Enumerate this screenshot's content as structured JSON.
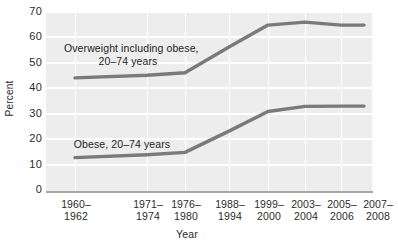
{
  "chart_data": {
    "type": "line",
    "title": "",
    "xlabel": "Year",
    "ylabel": "Percent",
    "ylim": [
      0,
      70
    ],
    "ytick_values": [
      70,
      60,
      50,
      40,
      30,
      20,
      10,
      0
    ],
    "grid": true,
    "legend_position": "inline-annotation",
    "categories": [
      "1960–1962",
      "1971–1974",
      "1976–1980",
      "1988–1994",
      "1999–2000",
      "2003–2004",
      "2005–2006",
      "2007–2008"
    ],
    "series": [
      {
        "name": "Overweight including obese, 20–74 years",
        "color": "#7a7a7a",
        "values": [
          44.0,
          45.0,
          46.0,
          56.0,
          64.5,
          65.7,
          64.5,
          64.5
        ]
      },
      {
        "name": "Obese, 20–74 years",
        "color": "#7a7a7a",
        "values": [
          13.0,
          14.1,
          15.0,
          23.3,
          30.9,
          32.9,
          33.0,
          33.0
        ]
      }
    ],
    "annotations": [
      {
        "id": "overweight",
        "line1": "Overweight including obese,",
        "line2": "20–74 years"
      },
      {
        "id": "obese",
        "line1": "Obese, 20–74 years",
        "line2": ""
      }
    ],
    "colors": {
      "plot_background": "#ededed",
      "gridline": "#ffffff",
      "line": "#7a7a7a",
      "axis": "#a8a8a8",
      "text": "#2b2b2b"
    }
  },
  "axes": {
    "y_title": "Percent",
    "x_title": "Year",
    "y_ticks": [
      {
        "label": "70"
      },
      {
        "label": "60"
      },
      {
        "label": "50"
      },
      {
        "label": "40"
      },
      {
        "label": "30"
      },
      {
        "label": "20"
      },
      {
        "label": "10"
      },
      {
        "label": "0"
      }
    ],
    "x_ticks": [
      {
        "top": "1960–",
        "bottom": "1962"
      },
      {
        "top": "1971–",
        "bottom": "1974"
      },
      {
        "top": "1976–",
        "bottom": "1980"
      },
      {
        "top": "1988–",
        "bottom": "1994"
      },
      {
        "top": "1999–",
        "bottom": "2000"
      },
      {
        "top": "2003–",
        "bottom": "2004"
      },
      {
        "top": "2005–",
        "bottom": "2006"
      },
      {
        "top": "2007–",
        "bottom": "2008"
      }
    ]
  },
  "annotations": {
    "overweight_line1": "Overweight including obese,",
    "overweight_line2": "20–74 years",
    "obese_line1": "Obese, 20–74 years"
  }
}
